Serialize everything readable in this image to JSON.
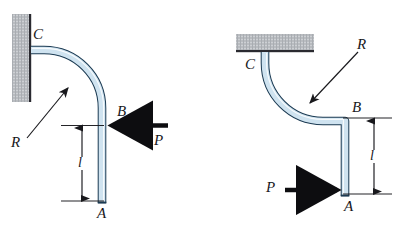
{
  "figure": {
    "name": "curved-pipe-bracket-diagram",
    "background": "#ffffff",
    "ink": "#18181c",
    "panels": [
      {
        "id": "left-panel",
        "support": {
          "type": "wall-vertical",
          "fill": "#b9bcc0",
          "edge": "#2a2a30",
          "x": 12,
          "y": 14,
          "w": 18,
          "h": 88
        },
        "pipe": {
          "fill": "#cfe3f0",
          "stroke": "#1b3a52",
          "highlight": "#ffffff",
          "thickness": 7,
          "path": "curve-then-down"
        },
        "labels": {
          "c": "C",
          "r": "R",
          "b": "B",
          "a": "A",
          "l": "l",
          "p": "P"
        },
        "force": {
          "symbol": "P",
          "direction": "left",
          "color": "#0d0d10"
        },
        "dimension": {
          "symbol": "l",
          "orientation": "vertical",
          "side": "left"
        }
      },
      {
        "id": "right-panel",
        "support": {
          "type": "wall-horizontal",
          "fill": "#b9bcc0",
          "edge": "#2a2a30",
          "x": 236,
          "y": 34,
          "w": 78,
          "h": 18
        },
        "pipe": {
          "fill": "#cfe3f0",
          "stroke": "#1b3a52",
          "highlight": "#ffffff",
          "thickness": 7,
          "path": "down-curve-then-down"
        },
        "labels": {
          "c": "C",
          "r": "R",
          "b": "B",
          "a": "A",
          "l": "l",
          "p": "P"
        },
        "force": {
          "symbol": "P",
          "direction": "right",
          "color": "#0d0d10"
        },
        "dimension": {
          "symbol": "l",
          "orientation": "vertical",
          "side": "right"
        }
      }
    ]
  }
}
